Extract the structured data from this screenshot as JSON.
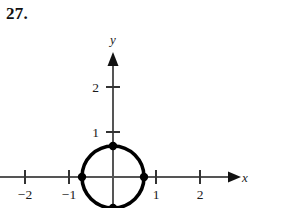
{
  "figure": {
    "problem_number": "27.",
    "axes": {
      "x_label": "x",
      "y_label": "y",
      "x_ticks": [
        {
          "value": -2,
          "label": "−2"
        },
        {
          "value": -1,
          "label": "−1"
        },
        {
          "value": 1,
          "label": "1"
        },
        {
          "value": 2,
          "label": "2"
        }
      ],
      "y_ticks": [
        {
          "value": 1,
          "label": "1"
        },
        {
          "value": 2,
          "label": "2"
        }
      ]
    },
    "curve": {
      "type": "circle",
      "center": [
        0,
        0
      ],
      "radius": 0.7,
      "stroke_color": "#000000"
    },
    "points": [
      {
        "label": "top",
        "x": 0,
        "y": 0.7
      },
      {
        "label": "right",
        "x": 0.7,
        "y": 0
      },
      {
        "label": "bottom",
        "x": 0,
        "y": -0.7
      },
      {
        "label": "left",
        "x": -0.7,
        "y": 0
      }
    ],
    "colors": {
      "background": "#ffffff",
      "ink": "#000000",
      "axis": "#555555"
    }
  }
}
